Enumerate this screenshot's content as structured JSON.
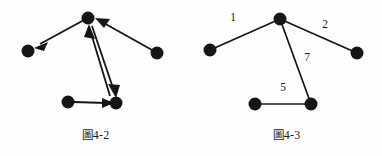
{
  "page": {
    "background_color": "#fefefe",
    "ink_color": "#151515",
    "width": 382,
    "height": 156
  },
  "figures": [
    {
      "id": "fig-4-2",
      "caption": "圖4-2",
      "caption_cjk": "圖",
      "caption_latin": "4-2",
      "graph_type": "directed",
      "weighted": false,
      "nodes": [
        {
          "id": "n-top",
          "label": "",
          "x": 88,
          "y": 18,
          "r": 6.5
        },
        {
          "id": "n-left",
          "label": "",
          "x": 28,
          "y": 51,
          "r": 6.5
        },
        {
          "id": "n-right",
          "label": "",
          "x": 157,
          "y": 53,
          "r": 6.5
        },
        {
          "id": "n-bottom-left",
          "label": "",
          "x": 68,
          "y": 102,
          "r": 6.5
        },
        {
          "id": "n-bottom-right",
          "label": "",
          "x": 116,
          "y": 103,
          "r": 6.5
        }
      ],
      "edges": [
        {
          "from": "n-top",
          "to": "n-left",
          "directed": true,
          "weight": ""
        },
        {
          "from": "n-right",
          "to": "n-top",
          "directed": true,
          "weight": ""
        },
        {
          "from": "n-bottom-right",
          "to": "n-top",
          "directed": true,
          "weight": ""
        },
        {
          "from": "n-top",
          "to": "n-bottom-right",
          "directed": true,
          "weight": ""
        },
        {
          "from": "n-bottom-left",
          "to": "n-bottom-right",
          "directed": true,
          "weight": ""
        }
      ]
    },
    {
      "id": "fig-4-3",
      "caption": "圖4-3",
      "caption_cjk": "圖",
      "caption_latin": "4-3",
      "graph_type": "undirected",
      "weighted": true,
      "nodes": [
        {
          "id": "m-top",
          "label": "",
          "x": 89,
          "y": 19,
          "r": 6.5
        },
        {
          "id": "m-left",
          "label": "",
          "x": 19,
          "y": 50,
          "r": 6.5
        },
        {
          "id": "m-right",
          "label": "",
          "x": 166,
          "y": 53,
          "r": 6.5
        },
        {
          "id": "m-bottom-left",
          "label": "",
          "x": 64,
          "y": 104,
          "r": 6.5
        },
        {
          "id": "m-bottom-right",
          "label": "",
          "x": 120,
          "y": 104,
          "r": 6.5
        }
      ],
      "edges": [
        {
          "from": "m-left",
          "to": "m-top",
          "directed": false,
          "weight": "1",
          "label_x": 42,
          "label_y": 18
        },
        {
          "from": "m-top",
          "to": "m-right",
          "directed": false,
          "weight": "2",
          "label_x": 134,
          "label_y": 25
        },
        {
          "from": "m-top",
          "to": "m-bottom-right",
          "directed": false,
          "weight": "7",
          "label_x": 116,
          "label_y": 58
        },
        {
          "from": "m-bottom-left",
          "to": "m-bottom-right",
          "directed": false,
          "weight": "5",
          "label_x": 92,
          "label_y": 88
        }
      ]
    }
  ]
}
